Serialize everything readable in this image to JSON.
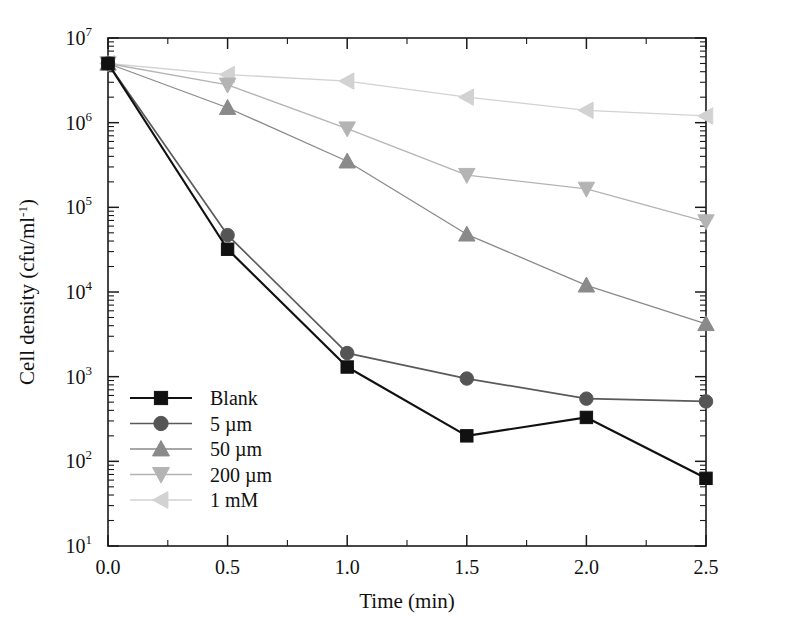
{
  "chart_data": {
    "type": "line",
    "title": "",
    "xlabel": "Time (min)",
    "ylabel": "Cell density (cfu/ml⁻¹)",
    "ylabel_main": "Cell density (cfu/ml",
    "ylabel_sup": "-1",
    "ylabel_tail": ")",
    "x": [
      0.0,
      0.5,
      1.0,
      1.5,
      2.0,
      2.5
    ],
    "xtick_labels": [
      "0.0",
      "0.5",
      "1.0",
      "1.5",
      "2.0",
      "2.5"
    ],
    "xlim": [
      0.0,
      2.5
    ],
    "ylim": [
      10,
      10000000
    ],
    "yscale": "log",
    "ytick_values": [
      10,
      100,
      1000,
      10000,
      100000,
      1000000,
      10000000
    ],
    "ytick_labels": [
      {
        "base": "10",
        "exp": "1"
      },
      {
        "base": "10",
        "exp": "2"
      },
      {
        "base": "10",
        "exp": "3"
      },
      {
        "base": "10",
        "exp": "4"
      },
      {
        "base": "10",
        "exp": "5"
      },
      {
        "base": "10",
        "exp": "6"
      },
      {
        "base": "10",
        "exp": "7"
      }
    ],
    "grid": false,
    "legend_position": "lower-left-inside",
    "series": [
      {
        "name": "Blank",
        "label": "Blank",
        "marker": "square",
        "color": "#111111",
        "line_color": "#111111",
        "values": [
          5000000,
          32000,
          1300,
          200,
          330,
          63
        ]
      },
      {
        "name": "5 µm",
        "label": "5 µm",
        "marker": "circle",
        "color": "#555555",
        "line_color": "#5a5a5a",
        "values": [
          5000000,
          47000,
          1900,
          950,
          550,
          510
        ]
      },
      {
        "name": "50 µm",
        "label": "50 µm",
        "marker": "triangle-up",
        "color": "#8a8a8a",
        "line_color": "#8a8a8a",
        "values": [
          5000000,
          1500000,
          350000,
          48000,
          12000,
          4200
        ]
      },
      {
        "name": "200 µm",
        "label": "200 µm",
        "marker": "triangle-down",
        "color": "#b4b4b4",
        "line_color": "#b4b4b4",
        "values": [
          5000000,
          2800000,
          850000,
          240000,
          165000,
          68000
        ]
      },
      {
        "name": "1 mM",
        "label": "1 mM",
        "marker": "triangle-left",
        "color": "#d2d2d2",
        "line_color": "#d2d2d2",
        "values": [
          5000000,
          3700000,
          3100000,
          2000000,
          1400000,
          1200000
        ]
      }
    ]
  },
  "figure": {
    "background": "#ffffff",
    "axis_color": "#1a1a1a"
  }
}
